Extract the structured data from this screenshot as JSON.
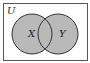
{
  "diagram": {
    "type": "venn",
    "universe_label": "U",
    "sets": [
      {
        "label": "X",
        "cx": 32,
        "cy": 34,
        "r": 20
      },
      {
        "label": "Y",
        "cx": 58,
        "cy": 34,
        "r": 20
      }
    ],
    "shaded_region": "X ∪ Y",
    "colors": {
      "fill": "#b9b9b9",
      "stroke": "#333333",
      "background": "#ffffff"
    }
  }
}
